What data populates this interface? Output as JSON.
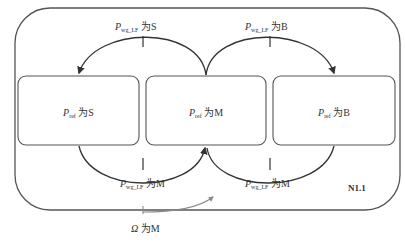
{
  "diagram": {
    "outer_box_label": "N1.1",
    "states": [
      {
        "id": "S",
        "symbol": "P",
        "subscript": "ref",
        "text": " 为S"
      },
      {
        "id": "M",
        "symbol": "P",
        "subscript": "ref",
        "text": " 为M"
      },
      {
        "id": "B",
        "symbol": "P",
        "subscript": "ref",
        "text": " 为B"
      }
    ],
    "transitions": [
      {
        "from": "M",
        "to": "S",
        "position": "top-left",
        "symbol": "P",
        "subscript": "wg_LF",
        "text": " 为S"
      },
      {
        "from": "M",
        "to": "B",
        "position": "top-right",
        "symbol": "P",
        "subscript": "wg_LF",
        "text": " 为B"
      },
      {
        "from": "S",
        "to": "M",
        "position": "bottom-left",
        "symbol": "P",
        "subscript": "wg_LF",
        "text": " 为M"
      },
      {
        "from": "B",
        "to": "M",
        "position": "bottom-right",
        "symbol": "P",
        "subscript": "wg_LF",
        "text": " 为M"
      }
    ],
    "external_trigger": {
      "symbol": "Ω",
      "text": " 为M",
      "target": "outer-box"
    },
    "colors": {
      "line": "#333333",
      "box": "#555555",
      "arrow_external": "#888888"
    }
  }
}
